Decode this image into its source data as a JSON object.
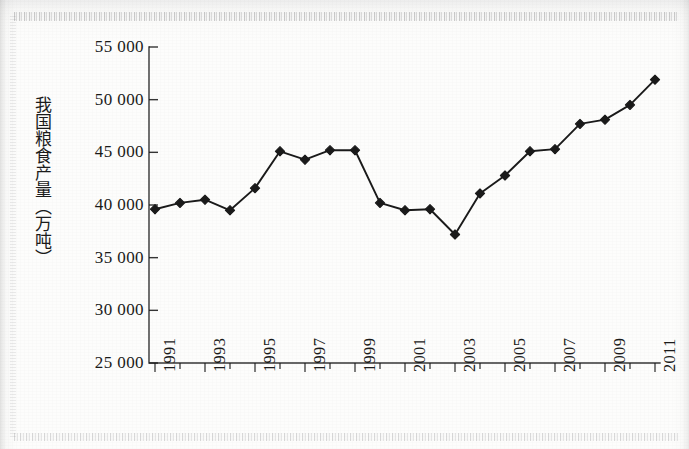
{
  "document": {
    "kind": "scanned-textbook-figure",
    "ink_color": "#1a1a1a",
    "paper_color": "#fcfcfb"
  },
  "chart_data": {
    "type": "line",
    "title": "",
    "xlabel": "",
    "ylabel": "我国粮食产量（万吨）",
    "ylim": [
      25000,
      55000
    ],
    "ytick_step": 5000,
    "ytick_labels": [
      "55 000",
      "50 000",
      "45 000",
      "40 000",
      "35 000",
      "30 000",
      "25 000"
    ],
    "ytick_values": [
      55000,
      50000,
      45000,
      40000,
      35000,
      30000,
      25000
    ],
    "grid": false,
    "legend": null,
    "marker": "diamond",
    "xtick_labels_shown": [
      "1991",
      "1993",
      "1995",
      "1997",
      "1999",
      "2001",
      "2003",
      "2005",
      "2007",
      "2009",
      "2011"
    ],
    "xtick_label_rotation": -90,
    "x": [
      1991,
      1992,
      1993,
      1994,
      1995,
      1996,
      1997,
      1998,
      1999,
      2000,
      2001,
      2002,
      2003,
      2004,
      2005,
      2006,
      2007,
      2008,
      2009,
      2010,
      2011
    ],
    "categories": [
      "1991",
      "1992",
      "1993",
      "1994",
      "1995",
      "1996",
      "1997",
      "1998",
      "1999",
      "2000",
      "2001",
      "2002",
      "2003",
      "2004",
      "2005",
      "2006",
      "2007",
      "2008",
      "2009",
      "2010",
      "2011"
    ],
    "values": [
      39600,
      40200,
      40500,
      39500,
      41600,
      45100,
      44300,
      45200,
      45200,
      40200,
      39500,
      39600,
      37200,
      41100,
      42800,
      45100,
      45300,
      47700,
      48100,
      49500,
      51900
    ],
    "series": [
      {
        "name": "我国粮食产量（万吨）",
        "values": [
          39600,
          40200,
          40500,
          39500,
          41600,
          45100,
          44300,
          45200,
          45200,
          40200,
          39500,
          39600,
          37200,
          41100,
          42800,
          45100,
          45300,
          47700,
          48100,
          49500,
          51900
        ]
      }
    ]
  }
}
